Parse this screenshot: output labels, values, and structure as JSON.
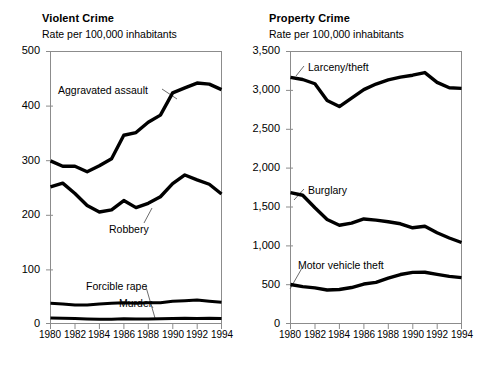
{
  "figure": {
    "background": "#ffffff",
    "line_color": "#000000",
    "axis_color": "#8c8c8c",
    "leader_color": "#5a5a5a"
  },
  "panels": [
    {
      "key": "violent",
      "title": "Violent Crime",
      "subtitle": "Rate per 100,000 inhabitants",
      "ytick_labels": [
        "500",
        "400",
        "300",
        "200",
        "100",
        "0"
      ],
      "xtick_labels": [
        "1980",
        "1982",
        "1984",
        "1986",
        "1988",
        "1990",
        "1992",
        "1994"
      ],
      "series_labels": [
        {
          "name": "aggravated-assault",
          "text": "Aggravated assault"
        },
        {
          "name": "robbery",
          "text": "Robbery"
        },
        {
          "name": "forcible-rape",
          "text": "Forcible rape"
        },
        {
          "name": "murder",
          "text": "Murder"
        }
      ]
    },
    {
      "key": "property",
      "title": "Property Crime",
      "subtitle": "Rate per 100,000 inhabitants",
      "ytick_labels": [
        "3,500",
        "3,000",
        "2,500",
        "2,000",
        "1,500",
        "1,000",
        "500",
        "0"
      ],
      "xtick_labels": [
        "1980",
        "1982",
        "1984",
        "1986",
        "1988",
        "1990",
        "1992",
        "1994"
      ],
      "series_labels": [
        {
          "name": "larceny-theft",
          "text": "Larceny/theft"
        },
        {
          "name": "burglary",
          "text": "Burglary"
        },
        {
          "name": "motor-vehicle-theft",
          "text": "Motor vehicle theft"
        }
      ]
    }
  ],
  "chart_data": [
    {
      "type": "line",
      "title": "Violent Crime",
      "subtitle": "Rate per 100,000 inhabitants",
      "xlabel": "",
      "ylabel": "Rate per 100,000 inhabitants",
      "xlim": [
        1980,
        1994
      ],
      "ylim": [
        0,
        500
      ],
      "yticks": [
        0,
        100,
        200,
        300,
        400,
        500
      ],
      "xticks": [
        1980,
        1982,
        1984,
        1986,
        1988,
        1990,
        1992,
        1994
      ],
      "grid": false,
      "legend": "inline-annotations",
      "x": [
        1980,
        1981,
        1982,
        1983,
        1984,
        1985,
        1986,
        1987,
        1988,
        1989,
        1990,
        1991,
        1992,
        1993,
        1994
      ],
      "series": [
        {
          "name": "Aggravated assault",
          "values": [
            299,
            289,
            289,
            279,
            290,
            303,
            346,
            351,
            370,
            383,
            424,
            433,
            442,
            440,
            430
          ]
        },
        {
          "name": "Robbery",
          "values": [
            251,
            258,
            239,
            217,
            205,
            209,
            226,
            213,
            221,
            233,
            257,
            273,
            264,
            256,
            238
          ]
        },
        {
          "name": "Forcible rape",
          "values": [
            37,
            36,
            34,
            34,
            36,
            37,
            38,
            37,
            38,
            38,
            41,
            42,
            43,
            41,
            39
          ]
        },
        {
          "name": "Murder",
          "values": [
            10.2,
            9.8,
            9.1,
            8.3,
            7.9,
            8.0,
            8.6,
            8.3,
            8.4,
            8.7,
            9.4,
            9.8,
            9.3,
            9.5,
            9.0
          ]
        }
      ]
    },
    {
      "type": "line",
      "title": "Property Crime",
      "subtitle": "Rate per 100,000 inhabitants",
      "xlabel": "",
      "ylabel": "Rate per 100,000 inhabitants",
      "xlim": [
        1980,
        1994
      ],
      "ylim": [
        0,
        3500
      ],
      "yticks": [
        0,
        500,
        1000,
        1500,
        2000,
        2500,
        3000,
        3500
      ],
      "xticks": [
        1980,
        1982,
        1984,
        1986,
        1988,
        1990,
        1992,
        1994
      ],
      "grid": false,
      "legend": "inline-annotations",
      "x": [
        1980,
        1981,
        1982,
        1983,
        1984,
        1985,
        1986,
        1987,
        1988,
        1989,
        1990,
        1991,
        1992,
        1993,
        1994
      ],
      "series": [
        {
          "name": "Larceny/theft",
          "values": [
            3167,
            3140,
            3085,
            2869,
            2791,
            2901,
            3010,
            3081,
            3135,
            3171,
            3195,
            3229,
            3103,
            3033,
            3026
          ]
        },
        {
          "name": "Burglary",
          "values": [
            1684,
            1650,
            1489,
            1338,
            1264,
            1292,
            1345,
            1330,
            1309,
            1283,
            1232,
            1252,
            1168,
            1100,
            1042
          ]
        },
        {
          "name": "Motor vehicle theft",
          "values": [
            502,
            475,
            459,
            431,
            437,
            463,
            508,
            529,
            583,
            630,
            658,
            659,
            632,
            606,
            591
          ]
        }
      ]
    }
  ]
}
